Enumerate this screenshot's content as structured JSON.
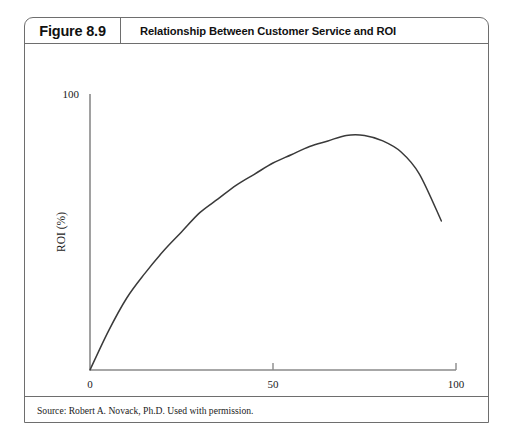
{
  "figure": {
    "number_label": "Figure 8.9",
    "title": "Relationship Between Customer Service and ROI",
    "source_note": "Source: Robert A. Novack, Ph.D. Used with permission."
  },
  "chart_data": {
    "type": "line",
    "title": "Relationship Between Customer Service and ROI",
    "xlabel": "Service Level (%)",
    "ylabel": "ROI (%)",
    "xlim": [
      0,
      100
    ],
    "ylim": [
      0,
      100
    ],
    "xticks": [
      0,
      50,
      100
    ],
    "xticklabels": [
      "0",
      "50",
      "100"
    ],
    "yticks": [
      0,
      100
    ],
    "yticklabels": [
      "0",
      "100"
    ],
    "grid": false,
    "legend": "none",
    "series": [
      {
        "name": "ROI vs Service Level",
        "color": "#3a3a3a",
        "x": [
          0,
          5,
          10,
          15,
          20,
          25,
          30,
          35,
          40,
          45,
          50,
          55,
          60,
          65,
          70,
          75,
          80,
          85,
          90,
          96
        ],
        "y": [
          0,
          14,
          26,
          35,
          43,
          50,
          57,
          62,
          67,
          71,
          75,
          78,
          81,
          83,
          85,
          85,
          83,
          79,
          71,
          54
        ]
      }
    ],
    "annotations": []
  },
  "axes": {
    "y_top_label": "100",
    "origin_label": "0",
    "x_mid_label": "50",
    "x_max_label": "100",
    "x_axis_title": "Service Level (%)",
    "y_axis_title": "ROI (%)"
  },
  "colors": {
    "border": "#6e6e6e",
    "axis": "#8a8a8a",
    "curve": "#3a3a3a",
    "text": "#111111",
    "background": "#ffffff"
  }
}
